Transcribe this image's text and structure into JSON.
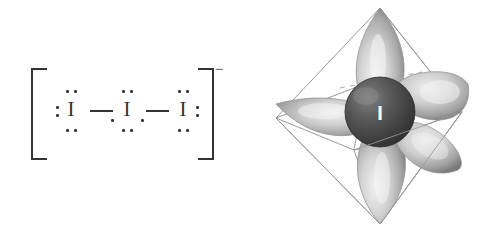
{
  "figure": {
    "background_color": "#ffffff"
  },
  "lewis_structure": {
    "name": "triiodide-lewis-structure",
    "overall_charge": "−",
    "bracket_color": "#333333",
    "bond_count": 2,
    "atoms": [
      {
        "id": "iodine-left",
        "symbol": "I",
        "lone_pairs": 3,
        "dot_positions": [
          "top",
          "left",
          "bottom"
        ]
      },
      {
        "id": "iodine-center",
        "symbol": "I",
        "lone_pairs": 3,
        "dot_positions": [
          "top",
          "bottom",
          "bottom-left",
          "bottom-right"
        ]
      },
      {
        "id": "iodine-right",
        "symbol": "I",
        "lone_pairs": 3,
        "dot_positions": [
          "top",
          "right",
          "bottom"
        ]
      }
    ],
    "bonds": [
      {
        "id": "bond-left",
        "from": "iodine-left",
        "to": "iodine-center",
        "order": 1
      },
      {
        "id": "bond-right",
        "from": "iodine-center",
        "to": "iodine-right",
        "order": 1
      }
    ]
  },
  "orbital_model": {
    "name": "triiodide-orbital-model",
    "geometry": "trigonal bipyramidal",
    "central_atom_label": "I",
    "central_atom_color": "#4a4a4a",
    "central_atom_text_color": "#ffffff",
    "lobe_fill_light": "#e8e8e8",
    "lobe_fill_mid": "#b8b8b8",
    "lobe_fill_dark": "#8a8a8a",
    "wireframe_color": "#9a9a9a",
    "lobe_count": 5,
    "lobes": [
      {
        "id": "lobe-top",
        "direction": "axial-up"
      },
      {
        "id": "lobe-bottom",
        "direction": "axial-down"
      },
      {
        "id": "lobe-left",
        "direction": "equatorial-left"
      },
      {
        "id": "lobe-upper-right",
        "direction": "equatorial-upper-right"
      },
      {
        "id": "lobe-lower-right",
        "direction": "equatorial-lower-right"
      }
    ]
  }
}
